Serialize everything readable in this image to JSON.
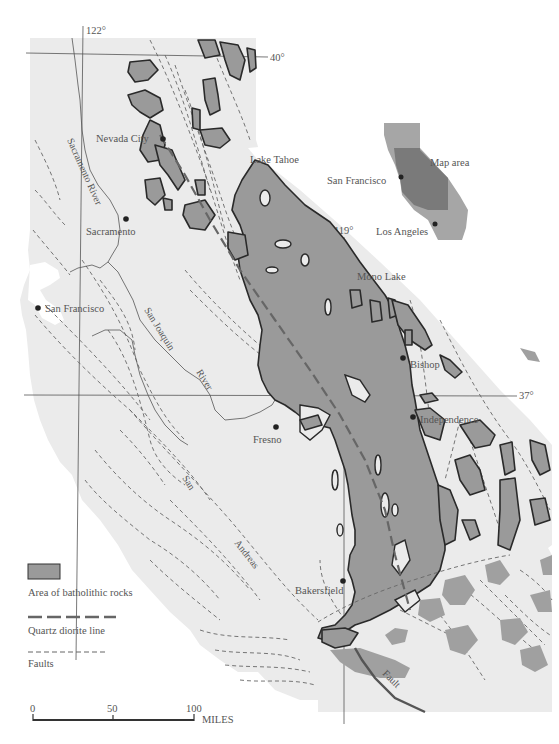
{
  "map": {
    "title": "Sierra Nevada batholith map",
    "colors": {
      "page_background": "#ffffff",
      "land": "#ebebeb",
      "batholith": "#9a9a9a",
      "outline": "#2a2a2a",
      "inset_map_area": "#7a7a7a",
      "inset_state": "#a6a6a6"
    },
    "graticule": {
      "lon_122": "122°",
      "lon_119": "119°",
      "lat_40": "40°",
      "lat_37": "37°"
    },
    "places": {
      "nevada_city": "Nevada City",
      "sacramento": "Sacramento",
      "san_francisco": "San Francisco",
      "lake_tahoe": "Lake Tahoe",
      "mono_lake": "Mono Lake",
      "bishop": "Bishop",
      "independence": "Independence",
      "fresno": "Fresno",
      "bakersfield": "Bakersfield"
    },
    "features": {
      "sacramento_river": "Sacramento River",
      "san_joaquin": "San Joaquin",
      "san_joaquin_river": "River",
      "san": "San",
      "andreas": "Andreas",
      "fault": "Fault"
    },
    "inset": {
      "map_area_label": "Map area",
      "san_francisco": "San Francisco",
      "los_angeles": "Los Angeles"
    },
    "legend": {
      "batholith_label": "Area of batholithic rocks",
      "quartz_diorite_label": "Quartz diorite line",
      "faults_label": "Faults"
    },
    "scale_bar": {
      "tick_0": "0",
      "tick_50": "50",
      "tick_100": "100",
      "unit": "MILES"
    }
  }
}
